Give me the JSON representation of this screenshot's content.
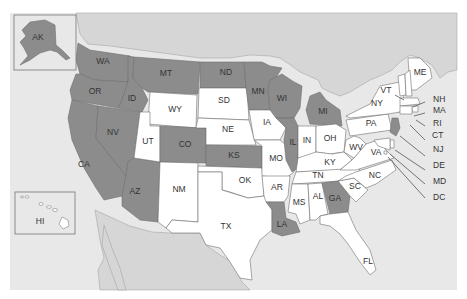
{
  "map": {
    "title": "",
    "colors": {
      "highlighted": "#8c8c8c",
      "default": "#ffffff",
      "foreign_land": "#d6d6d6",
      "water": "#e8e8e8",
      "inset_border": "#777777"
    },
    "insets": [
      {
        "id": "AK",
        "label": "AK"
      },
      {
        "id": "HI",
        "label": "HI"
      }
    ],
    "states": [
      {
        "id": "WA",
        "label": "WA",
        "highlighted": true
      },
      {
        "id": "OR",
        "label": "OR",
        "highlighted": true
      },
      {
        "id": "CA",
        "label": "CA",
        "highlighted": true
      },
      {
        "id": "ID",
        "label": "ID",
        "highlighted": true
      },
      {
        "id": "NV",
        "label": "NV",
        "highlighted": true
      },
      {
        "id": "AZ",
        "label": "AZ",
        "highlighted": true
      },
      {
        "id": "MT",
        "label": "MT",
        "highlighted": true
      },
      {
        "id": "WY",
        "label": "WY",
        "highlighted": false
      },
      {
        "id": "UT",
        "label": "UT",
        "highlighted": false
      },
      {
        "id": "CO",
        "label": "CO",
        "highlighted": true
      },
      {
        "id": "NM",
        "label": "NM",
        "highlighted": false
      },
      {
        "id": "ND",
        "label": "ND",
        "highlighted": true
      },
      {
        "id": "SD",
        "label": "SD",
        "highlighted": false
      },
      {
        "id": "NE",
        "label": "NE",
        "highlighted": false
      },
      {
        "id": "KS",
        "label": "KS",
        "highlighted": true
      },
      {
        "id": "OK",
        "label": "OK",
        "highlighted": false
      },
      {
        "id": "TX",
        "label": "TX",
        "highlighted": false
      },
      {
        "id": "MN",
        "label": "MN",
        "highlighted": true
      },
      {
        "id": "IA",
        "label": "IA",
        "highlighted": false
      },
      {
        "id": "MO",
        "label": "MO",
        "highlighted": false
      },
      {
        "id": "AR",
        "label": "AR",
        "highlighted": false
      },
      {
        "id": "LA",
        "label": "LA",
        "highlighted": true
      },
      {
        "id": "WI",
        "label": "WI",
        "highlighted": true
      },
      {
        "id": "IL",
        "label": "IL",
        "highlighted": true
      },
      {
        "id": "MI",
        "label": "MI",
        "highlighted": true
      },
      {
        "id": "IN",
        "label": "IN",
        "highlighted": false
      },
      {
        "id": "OH",
        "label": "OH",
        "highlighted": false
      },
      {
        "id": "KY",
        "label": "KY",
        "highlighted": false
      },
      {
        "id": "TN",
        "label": "TN",
        "highlighted": false
      },
      {
        "id": "MS",
        "label": "MS",
        "highlighted": false
      },
      {
        "id": "AL",
        "label": "AL",
        "highlighted": false
      },
      {
        "id": "GA",
        "label": "GA",
        "highlighted": true
      },
      {
        "id": "FL",
        "label": "FL",
        "highlighted": false
      },
      {
        "id": "SC",
        "label": "SC",
        "highlighted": false
      },
      {
        "id": "NC",
        "label": "NC",
        "highlighted": false
      },
      {
        "id": "VA",
        "label": "VA",
        "highlighted": false
      },
      {
        "id": "WV",
        "label": "WV",
        "highlighted": false
      },
      {
        "id": "PA",
        "label": "PA",
        "highlighted": false
      },
      {
        "id": "NY",
        "label": "NY",
        "highlighted": false
      },
      {
        "id": "VT",
        "label": "VT",
        "highlighted": false
      },
      {
        "id": "ME",
        "label": "ME",
        "highlighted": false
      },
      {
        "id": "NH",
        "label": "NH",
        "highlighted": false
      },
      {
        "id": "MA",
        "label": "MA",
        "highlighted": false
      },
      {
        "id": "RI",
        "label": "RI",
        "highlighted": false
      },
      {
        "id": "CT",
        "label": "CT",
        "highlighted": false
      },
      {
        "id": "NJ",
        "label": "NJ",
        "highlighted": true
      },
      {
        "id": "DE",
        "label": "DE",
        "highlighted": false
      },
      {
        "id": "MD",
        "label": "MD",
        "highlighted": false
      },
      {
        "id": "DC",
        "label": "DC",
        "highlighted": false
      }
    ]
  }
}
